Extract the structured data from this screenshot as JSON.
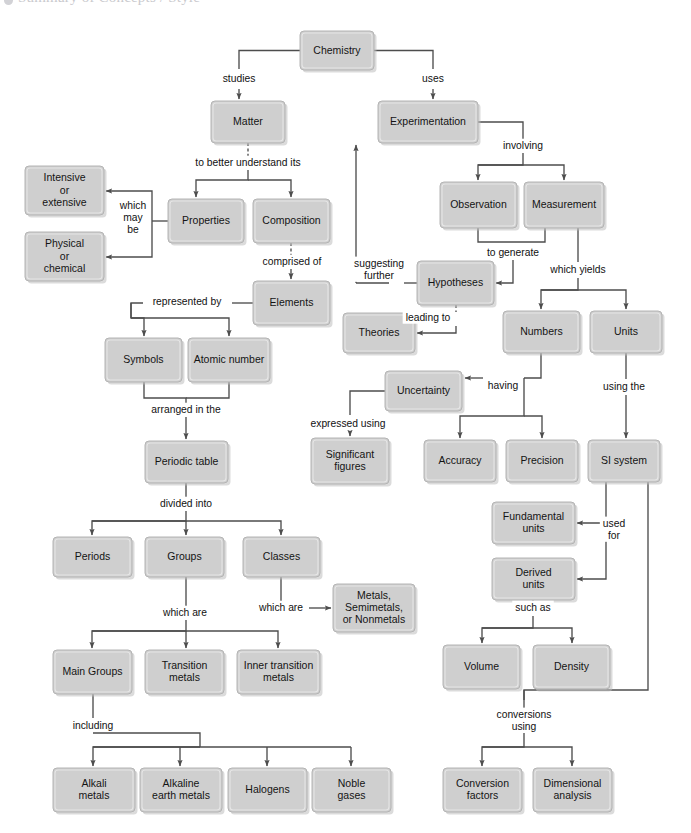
{
  "page": {
    "header_ghost": "Summary of Concepts / Style",
    "background": "#ffffff",
    "node_fill": "#cfcfcf",
    "node_stroke": "#b4b4b4",
    "line_color": "#4d4d4d",
    "text_color": "#141414"
  },
  "chart_data": {
    "type": "diagram",
    "nodes": [
      {
        "id": "chemistry",
        "label": "Chemistry",
        "x": 300,
        "y": 31,
        "w": 74,
        "h": 39
      },
      {
        "id": "matter",
        "label": "Matter",
        "x": 211,
        "y": 101,
        "w": 74,
        "h": 42
      },
      {
        "id": "experimentation",
        "label": "Experimentation",
        "x": 378,
        "y": 101,
        "w": 100,
        "h": 42
      },
      {
        "id": "intensive",
        "label": "Intensive|or|extensive",
        "x": 25,
        "y": 166,
        "w": 79,
        "h": 49
      },
      {
        "id": "physical",
        "label": "Physical|or|chemical",
        "x": 25,
        "y": 232,
        "w": 79,
        "h": 49
      },
      {
        "id": "properties",
        "label": "Properties",
        "x": 168,
        "y": 199,
        "w": 76,
        "h": 44
      },
      {
        "id": "composition",
        "label": "Composition",
        "x": 253,
        "y": 199,
        "w": 77,
        "h": 44
      },
      {
        "id": "observation",
        "label": "Observation",
        "x": 440,
        "y": 182,
        "w": 77,
        "h": 46
      },
      {
        "id": "measurement",
        "label": "Measurement",
        "x": 524,
        "y": 182,
        "w": 80,
        "h": 46
      },
      {
        "id": "elements",
        "label": "Elements",
        "x": 253,
        "y": 281,
        "w": 77,
        "h": 44
      },
      {
        "id": "hypotheses",
        "label": "Hypotheses",
        "x": 417,
        "y": 261,
        "w": 77,
        "h": 44
      },
      {
        "id": "symbols",
        "label": "Symbols",
        "x": 105,
        "y": 338,
        "w": 77,
        "h": 44
      },
      {
        "id": "atomicnumber",
        "label": "Atomic number",
        "x": 188,
        "y": 338,
        "w": 82,
        "h": 44
      },
      {
        "id": "theories",
        "label": "Theories",
        "x": 343,
        "y": 313,
        "w": 72,
        "h": 40
      },
      {
        "id": "numbers",
        "label": "Numbers",
        "x": 503,
        "y": 311,
        "w": 77,
        "h": 42
      },
      {
        "id": "units",
        "label": "Units",
        "x": 590,
        "y": 311,
        "w": 72,
        "h": 42
      },
      {
        "id": "uncertainty",
        "label": "Uncertainty",
        "x": 385,
        "y": 371,
        "w": 77,
        "h": 40
      },
      {
        "id": "periodictable",
        "label": "Periodic table",
        "x": 145,
        "y": 441,
        "w": 83,
        "h": 42
      },
      {
        "id": "accuracy",
        "label": "Accuracy",
        "x": 424,
        "y": 440,
        "w": 72,
        "h": 42
      },
      {
        "id": "precision",
        "label": "Precision",
        "x": 506,
        "y": 440,
        "w": 72,
        "h": 42
      },
      {
        "id": "sisystem",
        "label": "SI system",
        "x": 588,
        "y": 440,
        "w": 72,
        "h": 42
      },
      {
        "id": "significant",
        "label": "Significant|figures",
        "x": 311,
        "y": 438,
        "w": 78,
        "h": 46
      },
      {
        "id": "fundamental",
        "label": "Fundamental|units",
        "x": 492,
        "y": 502,
        "w": 83,
        "h": 42
      },
      {
        "id": "derived",
        "label": "Derived|units",
        "x": 492,
        "y": 558,
        "w": 83,
        "h": 42
      },
      {
        "id": "periods",
        "label": "Periods",
        "x": 53,
        "y": 537,
        "w": 79,
        "h": 40
      },
      {
        "id": "groups",
        "label": "Groups",
        "x": 145,
        "y": 537,
        "w": 79,
        "h": 40
      },
      {
        "id": "classes",
        "label": "Classes",
        "x": 243,
        "y": 537,
        "w": 77,
        "h": 40
      },
      {
        "id": "metalsetc",
        "label": "Metals,|Semimetals,|or Nonmetals",
        "x": 333,
        "y": 584,
        "w": 82,
        "h": 48
      },
      {
        "id": "maingroups",
        "label": "Main Groups",
        "x": 53,
        "y": 650,
        "w": 79,
        "h": 44
      },
      {
        "id": "transition",
        "label": "Transition|metals",
        "x": 145,
        "y": 650,
        "w": 79,
        "h": 44
      },
      {
        "id": "innertransition",
        "label": "Inner transition|metals",
        "x": 237,
        "y": 650,
        "w": 83,
        "h": 44
      },
      {
        "id": "volume",
        "label": "Volume",
        "x": 443,
        "y": 645,
        "w": 77,
        "h": 44
      },
      {
        "id": "density",
        "label": "Density",
        "x": 533,
        "y": 645,
        "w": 77,
        "h": 44
      },
      {
        "id": "alkali",
        "label": "Alkali|metals",
        "x": 53,
        "y": 768,
        "w": 82,
        "h": 44
      },
      {
        "id": "alkaline",
        "label": "Alkaline|earth metals",
        "x": 140,
        "y": 768,
        "w": 82,
        "h": 44
      },
      {
        "id": "halogens",
        "label": "Halogens",
        "x": 228,
        "y": 768,
        "w": 79,
        "h": 44
      },
      {
        "id": "noble",
        "label": "Noble|gases",
        "x": 312,
        "y": 768,
        "w": 79,
        "h": 44
      },
      {
        "id": "conversionf",
        "label": "Conversion|factors",
        "x": 443,
        "y": 768,
        "w": 79,
        "h": 44
      },
      {
        "id": "dimensional",
        "label": "Dimensional|analysis",
        "x": 533,
        "y": 768,
        "w": 79,
        "h": 44
      }
    ],
    "edge_labels": [
      {
        "id": "studies",
        "text": "studies",
        "x": 239,
        "y": 79
      },
      {
        "id": "uses",
        "text": "uses",
        "x": 433,
        "y": 79
      },
      {
        "id": "tobetter",
        "text": "to better understand its",
        "x": 248,
        "y": 163
      },
      {
        "id": "whichmaybe",
        "text": "which|may|be",
        "x": 133,
        "y": 218
      },
      {
        "id": "comprisedof",
        "text": "comprised of",
        "x": 292,
        "y": 262
      },
      {
        "id": "involving",
        "text": "involving",
        "x": 523,
        "y": 146
      },
      {
        "id": "representedby",
        "text": "represented by",
        "x": 187,
        "y": 302
      },
      {
        "id": "togenerate",
        "text": "to generate",
        "x": 513,
        "y": 253
      },
      {
        "id": "whichyields",
        "text": "which yields",
        "x": 578,
        "y": 270
      },
      {
        "id": "suggesting",
        "text": "suggesting|further",
        "x": 379,
        "y": 270
      },
      {
        "id": "leadingto",
        "text": "leading to",
        "x": 428,
        "y": 318
      },
      {
        "id": "arrangedin",
        "text": "arranged in the",
        "x": 186,
        "y": 410
      },
      {
        "id": "having",
        "text": "having",
        "x": 503,
        "y": 386
      },
      {
        "id": "usingthe",
        "text": "using the",
        "x": 624,
        "y": 387
      },
      {
        "id": "expressed",
        "text": "expressed using",
        "x": 348,
        "y": 424
      },
      {
        "id": "usedfor",
        "text": "used|for",
        "x": 614,
        "y": 530
      },
      {
        "id": "dividedinto",
        "text": "divided into",
        "x": 186,
        "y": 504
      },
      {
        "id": "suchas",
        "text": "such as",
        "x": 533,
        "y": 608
      },
      {
        "id": "whichare1",
        "text": "which are",
        "x": 185,
        "y": 613
      },
      {
        "id": "whichare2",
        "text": "which are",
        "x": 281,
        "y": 608
      },
      {
        "id": "including",
        "text": "including",
        "x": 93,
        "y": 726
      },
      {
        "id": "conversions",
        "text": "conversions|using",
        "x": 524,
        "y": 721
      }
    ]
  }
}
